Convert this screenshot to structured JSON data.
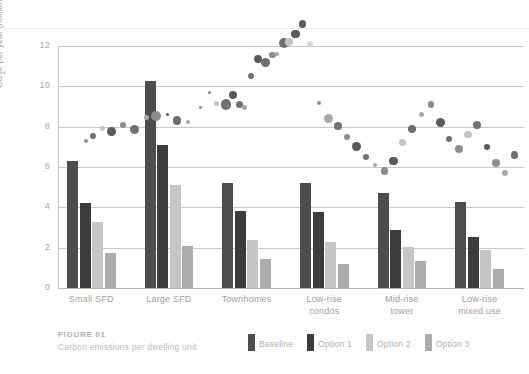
{
  "figure": {
    "caption_title": "FIGURE 01",
    "caption_subtitle": "Carbon emissions per dwelling unit"
  },
  "chart_data": {
    "type": "bar",
    "title": "Carbon emissions per dwelling unit",
    "xlabel": "",
    "ylabel": "CO₂e per year (million tonnes)",
    "ylim": [
      0,
      12
    ],
    "yticks": [
      0,
      2,
      4,
      6,
      8,
      10,
      12
    ],
    "ytick_labels": [
      "0",
      "2",
      "4",
      "6",
      "8",
      "10",
      "12"
    ],
    "grid": true,
    "legend_position": "bottom-right",
    "categories": [
      "Small SFD",
      "Large SFD",
      "Townhomes",
      "Low-rise condos",
      "Mid-rise tower",
      "Low-rise mixed use"
    ],
    "series": [
      {
        "name": "Baseline",
        "color": "#4d4d4d",
        "values": [
          6.3,
          10.25,
          5.2,
          5.2,
          4.7,
          4.25
        ]
      },
      {
        "name": "Option 1",
        "color": "#3c3c3c",
        "values": [
          4.2,
          7.1,
          3.8,
          3.75,
          2.9,
          2.55
        ]
      },
      {
        "name": "Option 2",
        "color": "#c6c6c6",
        "values": [
          3.25,
          5.1,
          2.4,
          2.3,
          2.05,
          1.9
        ]
      },
      {
        "name": "Option 3",
        "color": "#adadad",
        "values": [
          1.75,
          2.1,
          1.45,
          1.2,
          1.35,
          0.95
        ]
      }
    ],
    "overlay": {
      "type": "scatter",
      "note": "bubble cloud, ascending left-to-right, values 5.5 to 13.2",
      "colors": [
        "#5a5a5a",
        "#707070",
        "#8c8c8c",
        "#a8a8a8",
        "#c4c4c4",
        "#d8d8d8"
      ],
      "points": [
        {
          "x": 6.0,
          "y": 7.3,
          "r": 2.0,
          "c": "#8c8c8c"
        },
        {
          "x": 7.5,
          "y": 7.55,
          "r": 3.2,
          "c": "#707070"
        },
        {
          "x": 9.5,
          "y": 7.9,
          "r": 2.4,
          "c": "#c4c4c4"
        },
        {
          "x": 11.5,
          "y": 7.75,
          "r": 4.4,
          "c": "#5a5a5a"
        },
        {
          "x": 14.0,
          "y": 8.1,
          "r": 3.0,
          "c": "#8c8c8c"
        },
        {
          "x": 16.5,
          "y": 7.85,
          "r": 4.6,
          "c": "#707070"
        },
        {
          "x": 19.0,
          "y": 8.45,
          "r": 2.2,
          "c": "#a8a8a8"
        },
        {
          "x": 21.0,
          "y": 8.55,
          "r": 5.0,
          "c": "#8c8c8c"
        },
        {
          "x": 23.5,
          "y": 8.6,
          "r": 1.6,
          "c": "#5a5a5a"
        },
        {
          "x": 25.5,
          "y": 8.3,
          "r": 4.2,
          "c": "#707070"
        },
        {
          "x": 28.0,
          "y": 8.25,
          "r": 2.0,
          "c": "#a8a8a8"
        },
        {
          "x": 30.5,
          "y": 8.95,
          "r": 1.4,
          "c": "#8c8c8c"
        },
        {
          "x": 32.5,
          "y": 9.7,
          "r": 1.6,
          "c": "#8c8c8c"
        },
        {
          "x": 34.0,
          "y": 9.15,
          "r": 2.6,
          "c": "#c4c4c4"
        },
        {
          "x": 36.0,
          "y": 9.1,
          "r": 5.2,
          "c": "#707070"
        },
        {
          "x": 37.5,
          "y": 9.55,
          "r": 4.0,
          "c": "#5a5a5a"
        },
        {
          "x": 39.0,
          "y": 9.1,
          "r": 3.6,
          "c": "#707070"
        },
        {
          "x": 40.0,
          "y": 8.95,
          "r": 2.2,
          "c": "#a8a8a8"
        },
        {
          "x": 41.5,
          "y": 10.5,
          "r": 3.0,
          "c": "#707070"
        },
        {
          "x": 43.0,
          "y": 11.35,
          "r": 4.0,
          "c": "#5a5a5a"
        },
        {
          "x": 44.5,
          "y": 11.2,
          "r": 4.4,
          "c": "#707070"
        },
        {
          "x": 46.0,
          "y": 11.55,
          "r": 3.4,
          "c": "#8c8c8c"
        },
        {
          "x": 47.0,
          "y": 11.6,
          "r": 1.8,
          "c": "#a8a8a8"
        },
        {
          "x": 48.5,
          "y": 12.15,
          "r": 5.2,
          "c": "#707070"
        },
        {
          "x": 49.5,
          "y": 12.2,
          "r": 4.0,
          "c": "#c4c4c4"
        },
        {
          "x": 51.0,
          "y": 12.6,
          "r": 4.4,
          "c": "#5a5a5a"
        },
        {
          "x": 52.5,
          "y": 13.1,
          "r": 3.8,
          "c": "#5a5a5a"
        },
        {
          "x": 54.0,
          "y": 12.1,
          "r": 3.0,
          "c": "#d8d8d8"
        },
        {
          "x": 56.0,
          "y": 9.15,
          "r": 2.0,
          "c": "#8c8c8c"
        },
        {
          "x": 58.0,
          "y": 8.4,
          "r": 4.6,
          "c": "#a8a8a8"
        },
        {
          "x": 60.0,
          "y": 8.05,
          "r": 4.0,
          "c": "#707070"
        },
        {
          "x": 62.0,
          "y": 7.5,
          "r": 3.2,
          "c": "#8c8c8c"
        },
        {
          "x": 64.0,
          "y": 7.0,
          "r": 4.4,
          "c": "#5a5a5a"
        },
        {
          "x": 66.0,
          "y": 6.5,
          "r": 3.0,
          "c": "#707070"
        },
        {
          "x": 68.0,
          "y": 6.1,
          "r": 2.0,
          "c": "#a8a8a8"
        },
        {
          "x": 70.0,
          "y": 5.8,
          "r": 3.6,
          "c": "#8c8c8c"
        },
        {
          "x": 72.0,
          "y": 6.3,
          "r": 4.2,
          "c": "#5a5a5a"
        },
        {
          "x": 74.0,
          "y": 7.2,
          "r": 3.4,
          "c": "#c4c4c4"
        },
        {
          "x": 76.0,
          "y": 7.9,
          "r": 4.0,
          "c": "#707070"
        },
        {
          "x": 78.0,
          "y": 8.6,
          "r": 2.6,
          "c": "#a8a8a8"
        },
        {
          "x": 80.0,
          "y": 9.1,
          "r": 3.2,
          "c": "#8c8c8c"
        },
        {
          "x": 82.0,
          "y": 8.2,
          "r": 4.6,
          "c": "#5a5a5a"
        },
        {
          "x": 84.0,
          "y": 7.4,
          "r": 3.0,
          "c": "#707070"
        },
        {
          "x": 86.0,
          "y": 6.9,
          "r": 4.2,
          "c": "#8c8c8c"
        },
        {
          "x": 88.0,
          "y": 7.6,
          "r": 3.6,
          "c": "#c4c4c4"
        },
        {
          "x": 90.0,
          "y": 8.1,
          "r": 4.0,
          "c": "#707070"
        },
        {
          "x": 92.0,
          "y": 7.0,
          "r": 3.2,
          "c": "#5a5a5a"
        },
        {
          "x": 94.0,
          "y": 6.2,
          "r": 4.4,
          "c": "#8c8c8c"
        },
        {
          "x": 96.0,
          "y": 5.7,
          "r": 3.0,
          "c": "#a8a8a8"
        },
        {
          "x": 98.0,
          "y": 6.6,
          "r": 3.8,
          "c": "#707070"
        }
      ]
    },
    "legend": [
      "Baseline",
      "Option 1",
      "Option 2",
      "Option 3"
    ]
  }
}
